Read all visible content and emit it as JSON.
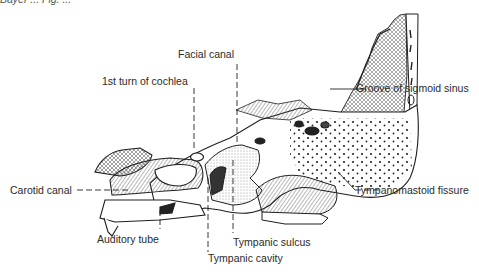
{
  "figure": {
    "top_caption_partial": "Bayer ... Fig. ...",
    "labels": {
      "facial_canal": "Facial canal",
      "cochlea": "1st turn of cochlea",
      "sigmoid": "Groove of sigmoid sinus",
      "carotid": "Carotid canal",
      "tympanomastoid": "Tympanomastoid fissure",
      "auditory_tube": "Auditory tube",
      "tympanic_sulcus": "Tympanic sulcus",
      "tympanic_cavity": "Tympanic cavity"
    },
    "colors": {
      "ink": "#1e1e1e",
      "paper": "#ffffff"
    }
  }
}
